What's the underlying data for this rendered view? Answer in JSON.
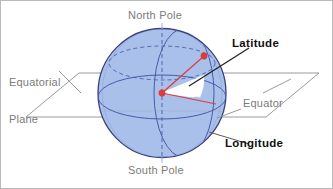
{
  "figure": {
    "background_color": "#ffffff",
    "border_color": "#b9b9b9"
  },
  "labels": {
    "north_pole": "North Pole",
    "south_pole": "South Pole",
    "equatorial_plane_line1": "Equatorial",
    "equatorial_plane_line2": "Plane",
    "equator": "Equator",
    "latitude": "Latitude",
    "longitude": "Longitude"
  },
  "colors": {
    "sphere_fill": "#a8c0ea",
    "sphere_outline": "#3a3f7a",
    "grid_line": "#4a5aa8",
    "plane_line": "#8e8e8e",
    "leader_line": "#8e8e8e",
    "marker_red": "#e03a3a",
    "angle_wedge_fill": "#ffffff",
    "label_gray": "#7b7b7b",
    "label_black": "#111111",
    "pointer_dark": "#232323"
  },
  "geometry": {
    "sphere_center_x": 161,
    "sphere_center_y": 92,
    "sphere_radius": 64,
    "surface_point_x": 203,
    "surface_point_y": 55,
    "equator_point_x": 215,
    "equator_point_y": 103
  },
  "elements": {
    "sphere": "globe-sphere",
    "polar_axis": "polar-axis-dashed",
    "equator_ellipse": "equator-ellipse",
    "meridian_ellipse": "prime-meridian-ellipse",
    "latitude_ellipse": "latitude-circle-dashed",
    "equatorial_plane": "equatorial-plane-parallelogram",
    "latitude_angle": "latitude-angle-wedge",
    "radius_to_point": "radius-line-to-surface-point",
    "radius_to_equator": "radius-line-to-equator"
  }
}
